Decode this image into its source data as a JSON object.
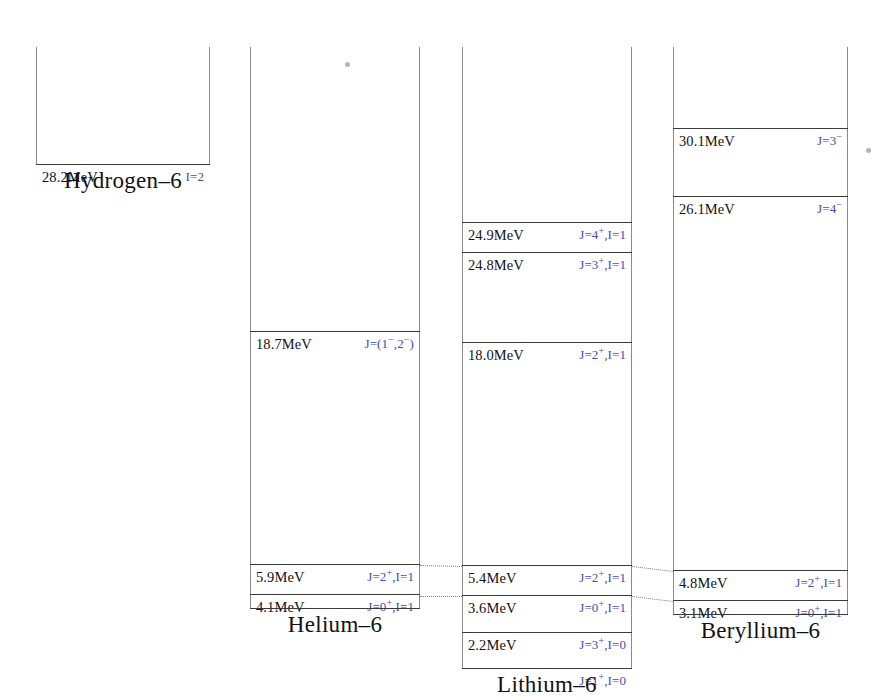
{
  "figure": {
    "accent_color": "#4a4ab4",
    "line_color": "#3a3a3a",
    "rail_color": "#8a8a8a"
  },
  "columns": [
    {
      "id": "hydrogen-6",
      "caption": "Hydrogen–6",
      "x": 36,
      "y": 47,
      "width": 174,
      "height": 117,
      "levels": [
        {
          "energy": "28.2MeV",
          "spin": "I=2",
          "y": 117
        }
      ]
    },
    {
      "id": "helium-6",
      "caption": "Helium–6",
      "x": 250,
      "y": 47,
      "width": 170,
      "height": 561,
      "levels": [
        {
          "energy": "18.7MeV",
          "spin": "J=(1−,2−)",
          "y": 284
        },
        {
          "energy": "5.9MeV",
          "spin": "J=2+,I=1",
          "y": 517
        },
        {
          "energy": "4.1MeV",
          "spin": "J=0+,I=1",
          "y": 547
        },
        {
          "energy": "",
          "spin": "",
          "y": 561
        }
      ]
    },
    {
      "id": "lithium-6",
      "caption": "Lithium–6",
      "x": 462,
      "y": 47,
      "width": 170,
      "height": 621,
      "levels": [
        {
          "energy": "24.9MeV",
          "spin": "J=4+,I=1",
          "y": 175
        },
        {
          "energy": "24.8MeV",
          "spin": "J=3+,I=1",
          "y": 205
        },
        {
          "energy": "18.0MeV",
          "spin": "J=2+,I=1",
          "y": 295
        },
        {
          "energy": "5.4MeV",
          "spin": "J=2+,I=1",
          "y": 518
        },
        {
          "energy": "3.6MeV",
          "spin": "J=0+,I=1",
          "y": 548
        },
        {
          "energy": "2.2MeV",
          "spin": "J=3+,I=0",
          "y": 585
        },
        {
          "energy": "",
          "spin": "J=1+,I=0",
          "y": 621
        }
      ]
    },
    {
      "id": "beryllium-6",
      "caption": "Beryllium–6",
      "x": 673,
      "y": 47,
      "width": 175,
      "height": 567,
      "levels": [
        {
          "energy": "30.1MeV",
          "spin": "J=3−",
          "y": 81
        },
        {
          "energy": "26.1MeV",
          "spin": "J=4−",
          "y": 149
        },
        {
          "energy": "4.8MeV",
          "spin": "J=2+,I=1",
          "y": 523
        },
        {
          "energy": "3.1MeV",
          "spin": "J=0+,I=1",
          "y": 553
        },
        {
          "energy": "",
          "spin": "",
          "y": 567
        }
      ]
    }
  ],
  "captions": [
    {
      "text": "Hydrogen–6",
      "x": 36,
      "y": 168,
      "width": 174
    },
    {
      "text": "Helium–6",
      "x": 250,
      "y": 612,
      "width": 170
    },
    {
      "text": "Lithium–6",
      "x": 462,
      "y": 672,
      "width": 170
    },
    {
      "text": "Beryllium–6",
      "x": 673,
      "y": 618,
      "width": 175
    }
  ],
  "connectors": [
    {
      "from": "helium-6 5.9MeV",
      "x1": 420,
      "y1": 565,
      "x2": 462,
      "y2": 566
    },
    {
      "from": "helium-6 4.1MeV",
      "x1": 420,
      "y1": 596,
      "x2": 462,
      "y2": 596
    },
    {
      "from": "lithium-6 5.4MeV",
      "x1": 632,
      "y1": 566,
      "x2": 673,
      "y2": 571
    },
    {
      "from": "lithium-6 3.6MeV",
      "x1": 632,
      "y1": 596,
      "x2": 673,
      "y2": 601
    }
  ],
  "marks": [
    {
      "name": "stray-speck-center",
      "x": 345,
      "y": 62
    },
    {
      "name": "stray-speck-right",
      "x": 866,
      "y": 148
    }
  ]
}
